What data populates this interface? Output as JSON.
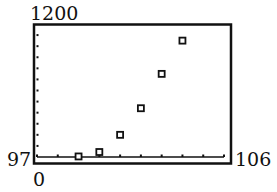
{
  "chart_data": {
    "type": "scatter",
    "title": "",
    "xlabel": "",
    "ylabel": "",
    "xlim": [
      97,
      106
    ],
    "ylim": [
      0,
      1200
    ],
    "grid": false,
    "legend": null,
    "x_ticks": [
      97,
      98,
      99,
      100,
      101,
      102,
      103,
      104,
      105,
      106
    ],
    "y_tick_step": 100,
    "window_labels": {
      "ymax": "1200",
      "xmin": "97",
      "xmax": "106",
      "ymin": "0"
    },
    "series": [
      {
        "name": "data",
        "marker": "square",
        "x": [
          99,
          100,
          101,
          102,
          103,
          104
        ],
        "y": [
          5,
          45,
          200,
          440,
          750,
          1050
        ]
      }
    ]
  }
}
